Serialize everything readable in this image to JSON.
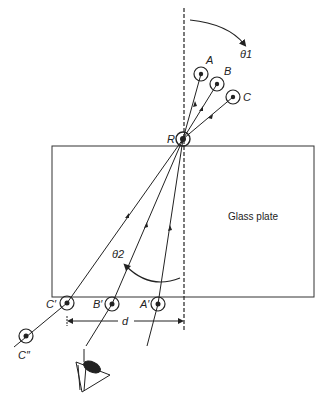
{
  "figure": {
    "plate_label": "Glass plate",
    "angle_labels": {
      "incident": "θ1",
      "refracted": "θ2"
    },
    "distance_label": "d",
    "point_labels": {
      "A": "A",
      "B": "B",
      "C": "C",
      "R": "R",
      "A_prime": "A′",
      "B_prime": "B′",
      "C_prime": "C′",
      "C_double_prime": "C″"
    },
    "icons": {
      "eye": "eye-icon",
      "marker": "circled-dot"
    },
    "colors": {
      "ink": "#222222",
      "background": "#ffffff"
    }
  }
}
